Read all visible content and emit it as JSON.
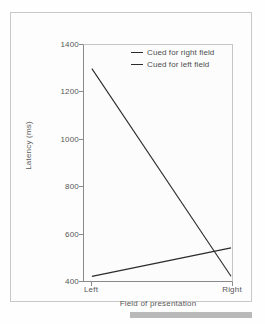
{
  "figure": {
    "background_color": "#fdfdfd",
    "frame_color": "#c9c9c9",
    "axis_color": "#8a8a8a",
    "line_color": "#2b2b2b",
    "artifact_bar_color": "#b9b9b9"
  },
  "chart_data": {
    "type": "line",
    "title": "",
    "xlabel": "Field of presentation",
    "ylabel": "Latency (ms)",
    "categories": [
      "Left",
      "Right"
    ],
    "x_tick_labels": [
      "Left",
      "Right"
    ],
    "y_tick_labels": [
      "400",
      "600",
      "800",
      "1000",
      "1200",
      "1400"
    ],
    "y_ticks": [
      400,
      600,
      800,
      1000,
      1200,
      1400
    ],
    "ylim": [
      400,
      1400
    ],
    "grid": false,
    "legend_position": "top-right-inside",
    "series": [
      {
        "name": "Cued for right field",
        "values": [
          1300,
          420
        ],
        "color": "#2b2b2b"
      },
      {
        "name": "Cued for left field",
        "values": [
          420,
          540
        ],
        "color": "#2b2b2b"
      }
    ]
  }
}
